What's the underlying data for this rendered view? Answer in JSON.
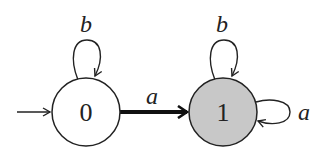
{
  "diagram": {
    "type": "finite-automaton",
    "states": [
      {
        "id": "0",
        "label": "0",
        "initial": true,
        "accepting": false,
        "fill": "#ffffff",
        "cx": 86,
        "cy": 112,
        "r": 34
      },
      {
        "id": "1",
        "label": "1",
        "initial": false,
        "accepting": true,
        "fill": "#c8c8c8",
        "cx": 223,
        "cy": 112,
        "r": 34
      }
    ],
    "transitions": [
      {
        "from": "0",
        "to": "0",
        "label": "b"
      },
      {
        "from": "0",
        "to": "1",
        "label": "a",
        "emphasized": true
      },
      {
        "from": "1",
        "to": "1",
        "label": "b"
      },
      {
        "from": "1",
        "to": "1",
        "label": "a"
      }
    ],
    "colors": {
      "stroke": "#222222",
      "accept_fill": "#c8c8c8"
    }
  }
}
